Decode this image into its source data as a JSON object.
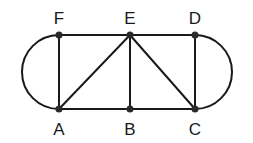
{
  "diagram": {
    "type": "graph",
    "nodes": [
      {
        "id": "F",
        "label": "F",
        "x": 59,
        "y": 35,
        "label_x": 59,
        "label_y": 24
      },
      {
        "id": "E",
        "label": "E",
        "x": 130,
        "y": 35,
        "label_x": 130,
        "label_y": 24
      },
      {
        "id": "D",
        "label": "D",
        "x": 195,
        "y": 35,
        "label_x": 195,
        "label_y": 24
      },
      {
        "id": "A",
        "label": "A",
        "x": 59,
        "y": 109,
        "label_x": 59,
        "label_y": 135
      },
      {
        "id": "B",
        "label": "B",
        "x": 130,
        "y": 109,
        "label_x": 130,
        "label_y": 135
      },
      {
        "id": "C",
        "label": "C",
        "x": 195,
        "y": 109,
        "label_x": 195,
        "label_y": 135
      }
    ],
    "edges": [
      {
        "from": "F",
        "to": "E",
        "kind": "straight"
      },
      {
        "from": "E",
        "to": "D",
        "kind": "straight"
      },
      {
        "from": "A",
        "to": "B",
        "kind": "straight"
      },
      {
        "from": "B",
        "to": "C",
        "kind": "straight"
      },
      {
        "from": "F",
        "to": "A",
        "kind": "straight"
      },
      {
        "from": "E",
        "to": "B",
        "kind": "straight"
      },
      {
        "from": "D",
        "to": "C",
        "kind": "straight"
      },
      {
        "from": "A",
        "to": "E",
        "kind": "straight"
      },
      {
        "from": "E",
        "to": "C",
        "kind": "straight"
      },
      {
        "from": "F",
        "to": "A",
        "kind": "arc-left"
      },
      {
        "from": "D",
        "to": "C",
        "kind": "arc-right"
      }
    ]
  }
}
